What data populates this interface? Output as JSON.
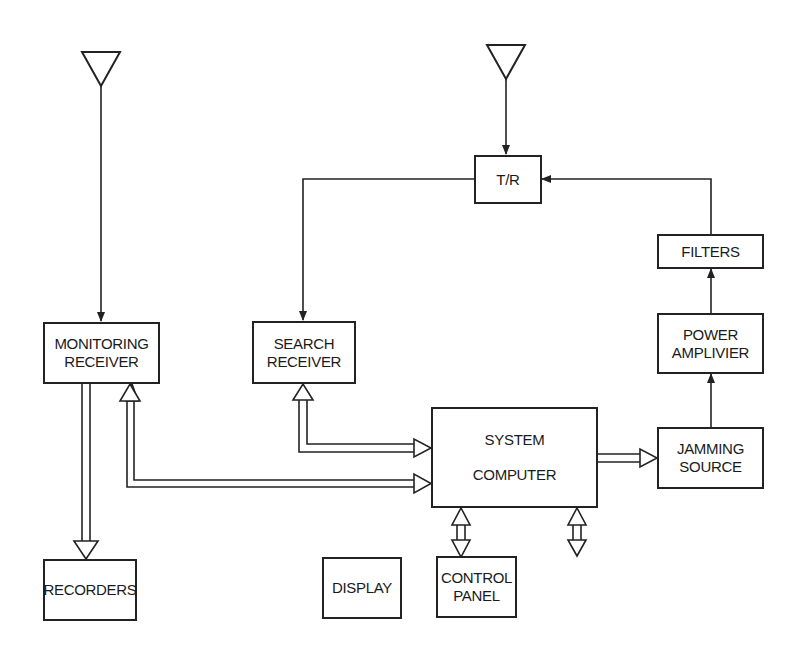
{
  "diagram": {
    "title": "",
    "blocks": {
      "monitoring_receiver": {
        "line1": "MONITORING",
        "line2": "RECEIVER"
      },
      "search_receiver": {
        "line1": "SEARCH",
        "line2": "RECEIVER"
      },
      "tr_switch": {
        "label": "T/R"
      },
      "filters": {
        "label": "FILTERS"
      },
      "power_amplifier": {
        "line1": "POWER",
        "line2": "AMPLIVIER"
      },
      "jamming_source": {
        "line1": "JAMMING",
        "line2": "SOURCE"
      },
      "system_computer": {
        "line1": "SYSTEM",
        "line2": "COMPUTER"
      },
      "recorders": {
        "label": "RECORDERS"
      },
      "display": {
        "label": "DISPLAY"
      },
      "control_panel": {
        "line1": "CONTROL",
        "line2": "PANEL"
      }
    },
    "antennas": [
      "monitoring-antenna",
      "transmit-receive-antenna"
    ],
    "connections": [
      {
        "from": "monitoring-antenna",
        "to": "monitoring_receiver",
        "type": "single-line-arrow"
      },
      {
        "from": "transmit-receive-antenna",
        "to": "tr_switch",
        "type": "single-line-arrow"
      },
      {
        "from": "tr_switch",
        "to": "search_receiver",
        "type": "single-line-arrow"
      },
      {
        "from": "filters",
        "to": "tr_switch",
        "type": "single-line-arrow"
      },
      {
        "from": "power_amplifier",
        "to": "filters",
        "type": "single-line-arrow"
      },
      {
        "from": "jamming_source",
        "to": "power_amplifier",
        "type": "single-line-arrow"
      },
      {
        "from": "monitoring_receiver",
        "to": "recorders",
        "type": "bus-arrow"
      },
      {
        "from": "system_computer",
        "to": "monitoring_receiver",
        "type": "bidirectional-bus"
      },
      {
        "from": "system_computer",
        "to": "search_receiver",
        "type": "bidirectional-bus"
      },
      {
        "from": "system_computer",
        "to": "jamming_source",
        "type": "bus-arrow"
      },
      {
        "from": "system_computer",
        "to": "display",
        "type": "bidirectional-bus"
      },
      {
        "from": "system_computer",
        "to": "control_panel",
        "type": "bidirectional-bus"
      }
    ],
    "colors": {
      "line": "#222222",
      "background": "#ffffff"
    }
  }
}
